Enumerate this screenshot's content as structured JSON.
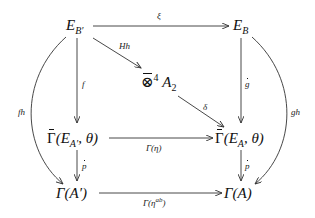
{
  "diagram": {
    "type": "commutative-diagram",
    "nodes": {
      "e_bprime": {
        "base": "E",
        "sub": "B′"
      },
      "e_b": {
        "base": "E",
        "sub": "B"
      },
      "tensor": {
        "base": "⊗",
        "sup": "4",
        "tail": "A",
        "tail_sub": "2"
      },
      "gamma_bar_eaprime": {
        "base": "Γ",
        "open": "(E",
        "sub": "A′",
        "close": ", θ)"
      },
      "gamma_bar_ea": {
        "base": "Γ",
        "open": "(E",
        "sub": "A",
        "close": ", θ)"
      },
      "gamma_aprime": {
        "text": "Γ(A′)"
      },
      "gamma_a": {
        "text": "Γ(A)"
      }
    },
    "arrows": [
      {
        "from": "e_bprime",
        "to": "e_b",
        "label": "ξ"
      },
      {
        "from": "e_bprime",
        "to": "tensor",
        "label": "Hh"
      },
      {
        "from": "tensor",
        "to": "gamma_bar_ea",
        "label": "δ"
      },
      {
        "from": "e_bprime",
        "to": "gamma_bar_eaprime",
        "label": "f̄"
      },
      {
        "from": "e_b",
        "to": "gamma_bar_ea",
        "label": "ḡ"
      },
      {
        "from": "gamma_bar_eaprime",
        "to": "gamma_bar_ea",
        "label": "Γ̄(η)"
      },
      {
        "from": "gamma_bar_eaprime",
        "to": "gamma_aprime",
        "label": "p̄"
      },
      {
        "from": "gamma_bar_ea",
        "to": "gamma_a",
        "label": "p̄"
      },
      {
        "from": "gamma_aprime",
        "to": "gamma_a",
        "label": "Γ(η^ab)"
      },
      {
        "from": "e_bprime",
        "to": "gamma_aprime",
        "label": "fh",
        "curved": true
      },
      {
        "from": "e_b",
        "to": "gamma_a",
        "label": "gh",
        "curved": true
      }
    ],
    "labels": {
      "xi": "ξ",
      "hh": "Hh",
      "delta": "δ",
      "fbar": "f",
      "gbar": "g",
      "gamma_eta": "Γ(η)",
      "pbar_left": "p",
      "pbar_right": "p",
      "gamma_eta_ab_base": "Γ(η",
      "gamma_eta_ab_sup": "ab",
      "gamma_eta_ab_close": ")",
      "fh": "fh",
      "gh": "gh"
    },
    "colors": {
      "line": "#333333",
      "text": "#111111",
      "background": "#ffffff"
    }
  }
}
